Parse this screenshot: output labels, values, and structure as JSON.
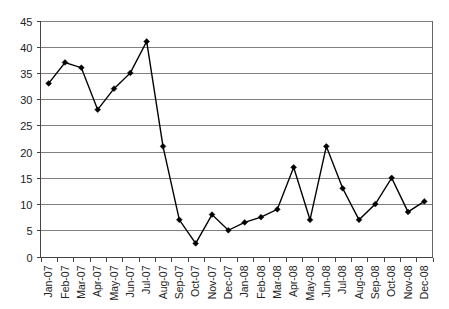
{
  "chart_data": {
    "type": "line",
    "title": "",
    "subtitle": "",
    "xlabel": "",
    "ylabel": "",
    "categories": [
      "Jan-07",
      "Feb-07",
      "Mar-07",
      "Apr-07",
      "May-07",
      "Jun-07",
      "Jul-07",
      "Aug-07",
      "Sep-07",
      "Oct-07",
      "Nov-07",
      "Dec-07",
      "Jan-08",
      "Feb-08",
      "Mar-08",
      "Apr-08",
      "May-08",
      "Jun-08",
      "Jul-08",
      "Aug-08",
      "Sep-08",
      "Oct-08",
      "Nov-08",
      "Dec-08"
    ],
    "values": [
      33,
      37,
      36,
      28,
      32,
      35,
      41,
      21,
      7,
      2.5,
      8,
      5,
      6.5,
      7.5,
      9,
      17,
      7,
      21,
      13,
      7,
      10,
      15,
      8.5,
      10.5
    ],
    "ylim": [
      0,
      45
    ],
    "yticks": [
      0,
      5,
      10,
      15,
      20,
      25,
      30,
      35,
      40,
      45
    ],
    "ytick_labels": [
      "0",
      "5",
      "10",
      "15",
      "20",
      "25",
      "30",
      "35",
      "40",
      "45"
    ],
    "grid": true,
    "grid_axis": "y",
    "legend": false,
    "legend_position": "none",
    "series": [
      {
        "name": "",
        "marker": "diamond",
        "line_color": "#000000",
        "marker_color": "#000000"
      }
    ],
    "colors": {
      "line": "#000000",
      "marker": "#000000",
      "gridline": "#808080",
      "frame": "#666666",
      "axis": "#444444",
      "tick_label": "#222222",
      "background": "#ffffff"
    }
  }
}
